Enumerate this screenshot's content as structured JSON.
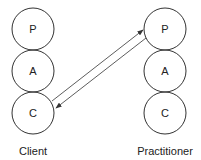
{
  "diagram": {
    "left": {
      "label": "Client",
      "circles": [
        "P",
        "A",
        "C"
      ]
    },
    "right": {
      "label": "Practitioner",
      "circles": [
        "P",
        "A",
        "C"
      ]
    },
    "arrows": [
      {
        "from": "Client C",
        "to": "Practitioner P"
      },
      {
        "from": "Practitioner P",
        "to": "Client C"
      }
    ],
    "colors": {
      "stroke": "#333333",
      "text": "#222222",
      "background": "#ffffff"
    }
  }
}
